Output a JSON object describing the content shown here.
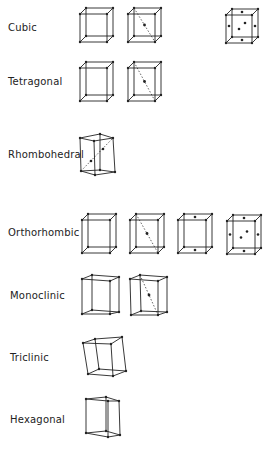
{
  "figure": {
    "rows": [
      {
        "system": "Cubic",
        "label_y": 29,
        "cells": [
          "primitive",
          "body-centred",
          "face-centred"
        ]
      },
      {
        "system": "Tetragonal",
        "label_y": 83,
        "cells": [
          "primitive",
          "body-centred"
        ]
      },
      {
        "system": "Rhombohedral",
        "label_y": 155,
        "cells": [
          "primitive"
        ]
      },
      {
        "system": "Orthorhombic",
        "label_y": 233,
        "cells": [
          "primitive",
          "body-centred",
          "base-centred",
          "face-centred"
        ]
      },
      {
        "system": "Monoclinic",
        "label_y": 297,
        "cells": [
          "primitive",
          "base-centred"
        ]
      },
      {
        "system": "Triclinic",
        "label_y": 358,
        "cells": [
          "primitive"
        ]
      },
      {
        "system": "Hexagonal",
        "label_y": 420,
        "cells": [
          "primitive"
        ]
      }
    ],
    "colors": {
      "line": "#222222",
      "background": "#ffffff"
    }
  }
}
